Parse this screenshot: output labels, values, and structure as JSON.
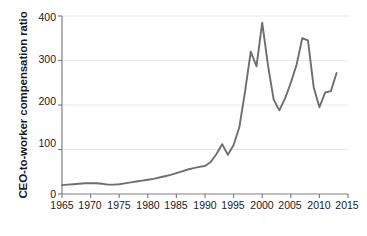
{
  "chart_data": {
    "type": "line",
    "title": "",
    "xlabel": "Year",
    "ylabel": "CEO-to-worker compensation ratio",
    "xlim": [
      1965,
      2015
    ],
    "ylim": [
      0,
      400
    ],
    "xticks": [
      1965,
      1970,
      1975,
      1980,
      1985,
      1990,
      1995,
      2000,
      2005,
      2010,
      2015
    ],
    "yticks": [
      0,
      100,
      200,
      300,
      400
    ],
    "grid": "horizontal",
    "legend": "none",
    "line_color": "#6e6e6e",
    "series": [
      {
        "name": "CEO-to-worker compensation ratio",
        "x": [
          1965,
          1966,
          1967,
          1968,
          1969,
          1970,
          1971,
          1972,
          1973,
          1974,
          1975,
          1976,
          1977,
          1978,
          1979,
          1980,
          1981,
          1982,
          1983,
          1984,
          1985,
          1986,
          1987,
          1988,
          1989,
          1990,
          1991,
          1992,
          1993,
          1994,
          1995,
          1996,
          1997,
          1998,
          1999,
          2000,
          2001,
          2002,
          2003,
          2004,
          2005,
          2006,
          2007,
          2008,
          2009,
          2010,
          2011,
          2012,
          2013
        ],
        "values": [
          20,
          21,
          22,
          23,
          24,
          24,
          24,
          23,
          21,
          21,
          22,
          24,
          26,
          28,
          30,
          32,
          34,
          37,
          40,
          43,
          47,
          51,
          55,
          58,
          61,
          63,
          72,
          90,
          112,
          88,
          110,
          150,
          230,
          320,
          287,
          385,
          290,
          212,
          188,
          215,
          250,
          290,
          350,
          345,
          240,
          195,
          228,
          231,
          272
        ]
      }
    ]
  },
  "axes": {
    "y_tick_labels": [
      "400",
      "300",
      "200",
      "100",
      "0"
    ],
    "x_tick_labels": [
      "1965",
      "1970",
      "1975",
      "1980",
      "1985",
      "1990",
      "1995",
      "2000",
      "2005",
      "2010",
      "2015"
    ]
  },
  "style": {
    "background": "#ffffff",
    "grid_color": "#e8e8e8",
    "axis_color": "#808080",
    "text_color": "#1a1a1a"
  }
}
